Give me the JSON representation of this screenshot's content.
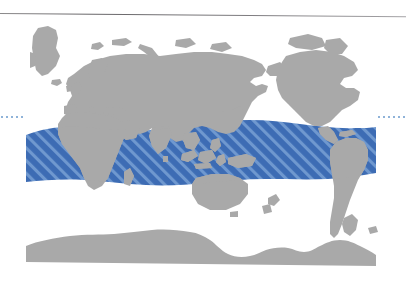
{
  "figure": {
    "kind": "world-distribution-map",
    "projection": "rectangular-equirectangular",
    "background_color": "#ffffff",
    "land_color": "#a9a9a9",
    "range_fill_color": "#3d6cb4",
    "range_hatch_color": "#6f98cf",
    "graticule_color": "#8fb3d9",
    "rule_color": "#6e6c70"
  },
  "map": {
    "plate": {
      "x": 0,
      "y": 22,
      "width": 406,
      "height": 250
    },
    "landmasses": [
      {
        "name": "greenland"
      },
      {
        "name": "eurasia"
      },
      {
        "name": "africa"
      },
      {
        "name": "north-america"
      },
      {
        "name": "south-america"
      },
      {
        "name": "australia"
      },
      {
        "name": "antarctica"
      },
      {
        "name": "madagascar"
      },
      {
        "name": "new-guinea"
      },
      {
        "name": "new-zealand"
      },
      {
        "name": "japan"
      },
      {
        "name": "indonesia"
      },
      {
        "name": "british-isles"
      },
      {
        "name": "iceland"
      },
      {
        "name": "sri-lanka"
      },
      {
        "name": "philippines"
      },
      {
        "name": "caribbean-islands"
      }
    ],
    "range_band": {
      "label": "distribution range",
      "fill": "#3d6cb4",
      "hatch_angle_deg": 45,
      "northern_limit_approx": "40 N",
      "southern_limit_approx": "40 S",
      "oceans_covered": [
        "Atlantic",
        "Indian",
        "Pacific"
      ]
    },
    "latitude_markers": {
      "left_stub": {
        "visible": true,
        "style": "dotted"
      },
      "right_stub": {
        "visible": true,
        "style": "dotted"
      }
    }
  }
}
